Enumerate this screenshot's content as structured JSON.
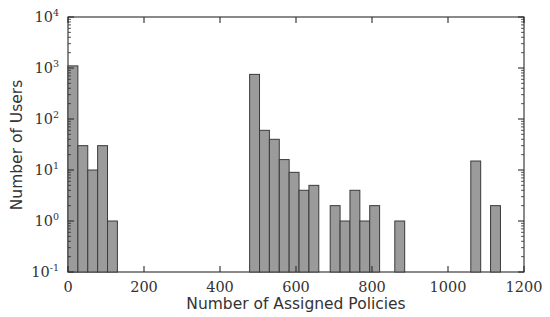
{
  "chart_data": {
    "type": "bar",
    "title": "",
    "subtitle": "",
    "xlabel": "Number of Assigned Policies",
    "ylabel": "Number of Users",
    "xlim": [
      0,
      1200
    ],
    "ylim": [
      0.1,
      10000
    ],
    "yscale": "log",
    "xscale": "linear",
    "grid": false,
    "legend": null,
    "bin_width": 26,
    "bar_color": "#9b9b9b",
    "bar_edge_color": "#3a3a3a",
    "xticks": [
      0,
      200,
      400,
      600,
      800,
      1000,
      1200
    ],
    "xtick_labels": [
      "0",
      "200",
      "400",
      "600",
      "800",
      "1000",
      "1200"
    ],
    "yticks": [
      0.1,
      1,
      10,
      100,
      1000,
      10000
    ],
    "ytick_labels": [
      "10−1",
      "10⁰",
      "10¹",
      "10²",
      "10³",
      "10⁴"
    ],
    "ytick_mantissa": "10",
    "ytick_exponents": [
      "-1",
      "0",
      "1",
      "2",
      "3",
      "4"
    ],
    "bars": [
      {
        "x0": 0,
        "x1": 26,
        "value": 1100
      },
      {
        "x0": 26,
        "x1": 52,
        "value": 30
      },
      {
        "x0": 52,
        "x1": 78,
        "value": 10
      },
      {
        "x0": 78,
        "x1": 104,
        "value": 30
      },
      {
        "x0": 104,
        "x1": 130,
        "value": 1
      },
      {
        "x0": 478,
        "x1": 504,
        "value": 750
      },
      {
        "x0": 504,
        "x1": 530,
        "value": 60
      },
      {
        "x0": 530,
        "x1": 556,
        "value": 40
      },
      {
        "x0": 556,
        "x1": 582,
        "value": 16
      },
      {
        "x0": 582,
        "x1": 608,
        "value": 9
      },
      {
        "x0": 608,
        "x1": 634,
        "value": 4
      },
      {
        "x0": 634,
        "x1": 660,
        "value": 5
      },
      {
        "x0": 690,
        "x1": 716,
        "value": 2
      },
      {
        "x0": 716,
        "x1": 742,
        "value": 1
      },
      {
        "x0": 742,
        "x1": 768,
        "value": 4
      },
      {
        "x0": 768,
        "x1": 794,
        "value": 1
      },
      {
        "x0": 794,
        "x1": 820,
        "value": 2
      },
      {
        "x0": 860,
        "x1": 886,
        "value": 1
      },
      {
        "x0": 1060,
        "x1": 1086,
        "value": 15
      },
      {
        "x0": 1112,
        "x1": 1138,
        "value": 2
      }
    ]
  },
  "plot": {
    "bounds": {
      "left": 68,
      "right": 524,
      "top": 17,
      "bottom": 272
    }
  }
}
